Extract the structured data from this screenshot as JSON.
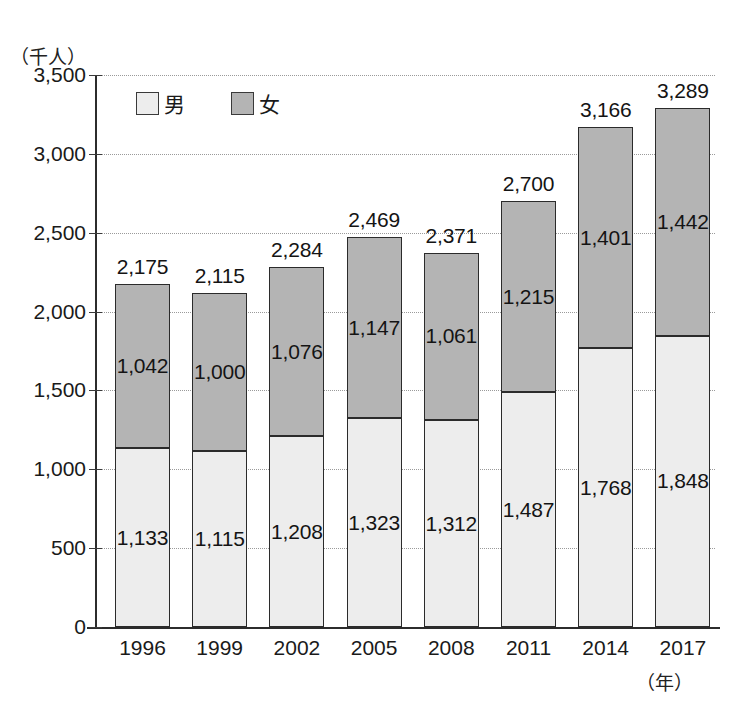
{
  "chart_data": {
    "type": "bar",
    "subtype": "stacked-bar",
    "title": "",
    "xlabel": "（年）",
    "ylabel": "（千人）",
    "categories": [
      "1996",
      "1999",
      "2002",
      "2005",
      "2008",
      "2011",
      "2014",
      "2017"
    ],
    "series": [
      {
        "name": "男",
        "key": "male",
        "color": "#ededed",
        "values": [
          1133,
          1115,
          1208,
          1323,
          1312,
          1487,
          1768,
          1848
        ],
        "labels": [
          "1,133",
          "1,115",
          "1,208",
          "1,323",
          "1,312",
          "1,487",
          "1,768",
          "1,848"
        ]
      },
      {
        "name": "女",
        "key": "female",
        "color": "#b4b4b4",
        "values": [
          1042,
          1000,
          1076,
          1147,
          1061,
          1215,
          1401,
          1442
        ],
        "labels": [
          "1,042",
          "1,000",
          "1,076",
          "1,147",
          "1,061",
          "1,215",
          "1,401",
          "1,442"
        ]
      }
    ],
    "totals": [
      2175,
      2115,
      2284,
      2469,
      2371,
      2700,
      3166,
      3289
    ],
    "total_labels": [
      "2,175",
      "2,115",
      "2,284",
      "2,469",
      "2,371",
      "2,700",
      "3,166",
      "3,289"
    ],
    "ylim": [
      0,
      3500
    ],
    "ytick_values": [
      0,
      500,
      1000,
      1500,
      2000,
      2500,
      3000,
      3500
    ],
    "ytick_labels": [
      "0",
      "500",
      "1,000",
      "1,500",
      "2,000",
      "2,500",
      "3,000",
      "3,500"
    ],
    "grid": true,
    "grid_style": "dotted",
    "legend_position": "top-left-inside"
  },
  "legend": {
    "items": [
      {
        "label": "男",
        "swatch_class": "male"
      },
      {
        "label": "女",
        "swatch_class": "female"
      }
    ]
  },
  "axes": {
    "y_unit": "（千人）",
    "x_unit": "（年）"
  }
}
